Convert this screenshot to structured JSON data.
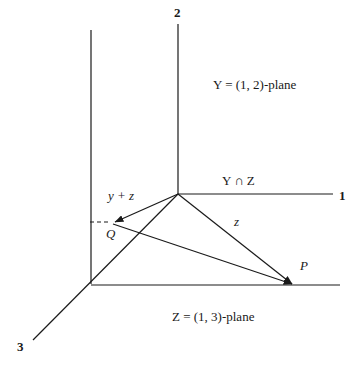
{
  "figure": {
    "kind": "geometry-diagram",
    "background_color": "#ffffff",
    "ink_color": "#1a1a1a",
    "width": 360,
    "height": 374
  },
  "axes": [
    {
      "id": "axis-1",
      "label": "1",
      "position": {
        "x": 341,
        "y": 196
      }
    },
    {
      "id": "axis-2",
      "label": "2",
      "position": {
        "x": 175,
        "y": 8
      }
    },
    {
      "id": "axis-3",
      "label": "3",
      "position": {
        "x": 18,
        "y": 341
      }
    }
  ],
  "plane_labels": [
    {
      "id": "plane-Y",
      "symbol": "Y",
      "equals": "=",
      "spec": "(1, 2)-plane",
      "text": "Y = (1, 2)-plane",
      "position": {
        "x": 228,
        "y": 76
      }
    },
    {
      "id": "plane-Z",
      "symbol": "Z",
      "equals": "=",
      "spec": "(1, 3)-plane",
      "text": "Z = (1, 3)-plane",
      "position": {
        "x": 175,
        "y": 308
      }
    }
  ],
  "intersection_label": {
    "id": "Y-intersect-Z",
    "text": "Y ∩ Z",
    "symbol_left": "Y",
    "operator": "∩",
    "symbol_right": "Z",
    "position": {
      "x": 226,
      "y": 177
    }
  },
  "vectors": [
    {
      "id": "vector-y-plus-z",
      "label": "y + z",
      "from": {
        "x": 178,
        "y": 194
      },
      "to": {
        "x": 113,
        "y": 223
      },
      "label_position": {
        "x": 113,
        "y": 192
      }
    },
    {
      "id": "vector-z",
      "label": "z",
      "from": {
        "x": 178,
        "y": 194
      },
      "to": {
        "x": 294,
        "y": 285
      },
      "label_position": {
        "x": 235,
        "y": 215
      }
    },
    {
      "id": "vector-origin-to-P",
      "label": "",
      "from": {
        "x": 113,
        "y": 223
      },
      "to": {
        "x": 294,
        "y": 285
      },
      "label_position": null
    }
  ],
  "points": [
    {
      "id": "point-Q",
      "label": "Q",
      "position": {
        "x": 113,
        "y": 223
      },
      "label_position": {
        "x": 107,
        "y": 227
      }
    },
    {
      "id": "point-P",
      "label": "P",
      "position": {
        "x": 294,
        "y": 285
      },
      "label_position": {
        "x": 301,
        "y": 261
      }
    }
  ],
  "guides": [
    {
      "id": "dashed-guide-to-Q",
      "style": "dashed",
      "from": {
        "x": 90,
        "y": 222
      },
      "to": {
        "x": 111,
        "y": 222
      }
    }
  ]
}
